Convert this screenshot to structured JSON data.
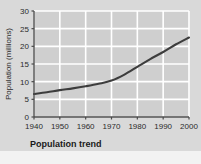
{
  "chart_data": {
    "type": "line",
    "title": "Population trend",
    "xlabel": "",
    "ylabel": "Population (millions)",
    "x": [
      1940,
      1945,
      1950,
      1955,
      1960,
      1965,
      1970,
      1975,
      1980,
      1985,
      1990,
      1995,
      2000
    ],
    "values": [
      6.5,
      7.0,
      7.6,
      8.1,
      8.7,
      9.4,
      10.3,
      12.0,
      14.2,
      16.4,
      18.4,
      20.6,
      22.5
    ],
    "series": [
      {
        "name": "Population",
        "values": [
          6.5,
          7.0,
          7.6,
          8.1,
          8.7,
          9.4,
          10.3,
          12.0,
          14.2,
          16.4,
          18.4,
          20.6,
          22.5
        ]
      }
    ],
    "xlim": [
      1940,
      2000
    ],
    "ylim": [
      0,
      30
    ],
    "xticks": [
      1940,
      1950,
      1960,
      1970,
      1980,
      1990,
      2000
    ],
    "yticks": [
      0,
      5,
      10,
      15,
      20,
      25,
      30
    ],
    "xtick_labels": [
      "1940",
      "1950",
      "1960",
      "1970",
      "1980",
      "1990",
      "2000"
    ],
    "ytick_labels": [
      "0",
      "5",
      "10",
      "15",
      "20",
      "25",
      "30"
    ],
    "grid": true,
    "legend": null,
    "legend_position": "none",
    "annotations": []
  },
  "figure": {
    "caption": "Population trend",
    "axis_y_title": "Population (millions)",
    "colors": {
      "background": "#d9d9d9",
      "plot_area": "#cfcfcf",
      "gridline": "#ffffff",
      "line": "#3d3d3d",
      "axis": "#4a4a4a",
      "text": "#2b2b2b",
      "caption": "#1a1a1a"
    }
  }
}
